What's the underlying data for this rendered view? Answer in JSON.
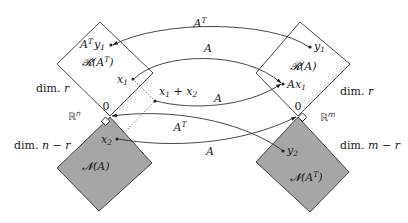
{
  "colors": {
    "background": "#ffffff",
    "null_space_fill": "#a6a6a6",
    "stroke": "#333333"
  },
  "left": {
    "space_label": "ℝ",
    "space_exp": "n",
    "row_space": {
      "name": "𝓡",
      "arg_open": "(A",
      "arg_sup": "T",
      "arg_close": ")",
      "dim_label": "dim. ",
      "dim_value": "r"
    },
    "null_space": {
      "name": "𝓝",
      "arg": "(A)",
      "dim_label": "dim. ",
      "dim_value": "n − r"
    },
    "origin": "0"
  },
  "right": {
    "space_label": "ℝ",
    "space_exp": "m",
    "column_space": {
      "name": "𝓡",
      "arg": "(A)",
      "dim_label": "dim. ",
      "dim_value": "r"
    },
    "left_null_space": {
      "name": "𝓝",
      "arg_open": "(A",
      "arg_sup": "T",
      "arg_close": ")",
      "dim_label": "dim. ",
      "dim_value": "m − r"
    },
    "origin": "0"
  },
  "points": {
    "ATy1": {
      "base": "A",
      "sup": "T",
      "var": "y",
      "sub": "1"
    },
    "x1": {
      "var": "x",
      "sub": "1"
    },
    "x1x2": {
      "var1": "x",
      "sub1": "1",
      "op": " + ",
      "var2": "x",
      "sub2": "2"
    },
    "x2": {
      "var": "x",
      "sub": "2"
    },
    "y1": {
      "var": "y",
      "sub": "1"
    },
    "Ax1": {
      "base": "A",
      "var": "x",
      "sub": "1"
    },
    "y2": {
      "var": "y",
      "sub": "2"
    }
  },
  "maps": {
    "top_AT": {
      "base": "A",
      "sup": "T"
    },
    "x1_to_Ax1": {
      "base": "A"
    },
    "sum_to_Ax1": {
      "base": "A"
    },
    "y2_to_zero": {
      "base": "A",
      "sup": "T"
    },
    "x2_to_zero": {
      "base": "A"
    }
  }
}
